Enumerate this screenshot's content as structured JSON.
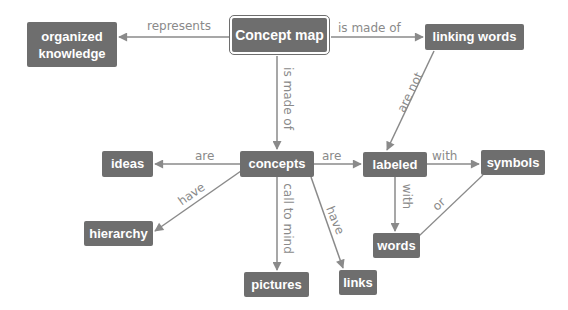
{
  "diagram": {
    "type": "concept-map",
    "colors": {
      "node_fill": "#6e6e6e",
      "node_text": "#ffffff",
      "edge_line": "#8a8a8a",
      "edge_label": "#8a8a8a",
      "background": "#ffffff"
    },
    "nodes": {
      "concept_map": {
        "label": "Concept map"
      },
      "organized_knowledge": {
        "label_line1": "organized",
        "label_line2": "knowledge"
      },
      "linking_words": {
        "label": "linking words"
      },
      "ideas": {
        "label": "ideas"
      },
      "concepts": {
        "label": "concepts"
      },
      "labeled": {
        "label": "labeled"
      },
      "symbols": {
        "label": "symbols"
      },
      "hierarchy": {
        "label": "hierarchy"
      },
      "pictures": {
        "label": "pictures"
      },
      "links": {
        "label": "links"
      },
      "words": {
        "label": "words"
      }
    },
    "edges": {
      "cm_to_ok": {
        "label": "represents",
        "from": "Concept map",
        "to": "organized knowledge"
      },
      "cm_to_lw": {
        "label": "is made of",
        "from": "Concept map",
        "to": "linking words"
      },
      "cm_to_concepts": {
        "label": "is made of",
        "from": "Concept map",
        "to": "concepts"
      },
      "lw_to_labeled": {
        "label": "are not",
        "from": "linking words",
        "to": "labeled"
      },
      "concepts_to_ideas": {
        "label": "are",
        "from": "concepts",
        "to": "ideas"
      },
      "concepts_to_labeled": {
        "label": "are",
        "from": "concepts",
        "to": "labeled"
      },
      "concepts_to_hierarchy": {
        "label": "have",
        "from": "concepts",
        "to": "hierarchy"
      },
      "concepts_to_pictures": {
        "label": "call to mind",
        "from": "concepts",
        "to": "pictures"
      },
      "concepts_to_links": {
        "label": "have",
        "from": "concepts",
        "to": "links"
      },
      "labeled_to_symbols": {
        "label": "with",
        "from": "labeled",
        "to": "symbols"
      },
      "labeled_to_words": {
        "label": "with",
        "from": "labeled",
        "to": "words"
      },
      "symbols_words": {
        "label": "or",
        "from": "symbols",
        "to": "words"
      }
    }
  }
}
